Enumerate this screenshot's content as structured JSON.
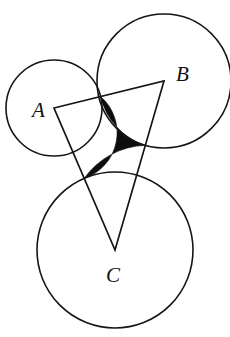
{
  "figure": {
    "width": 230,
    "height": 337,
    "background_color": "#ffffff",
    "stroke_color": "#151515",
    "shaded_color": "#0d0d0d"
  },
  "labels": {
    "a": "A",
    "b": "B",
    "c": "C"
  },
  "chart_data": {
    "type": "diagram",
    "circles": [
      {
        "name": "circle-A",
        "cx": 54,
        "cy": 108,
        "r": 48
      },
      {
        "name": "circle-B",
        "cx": 164,
        "cy": 81,
        "r": 67
      },
      {
        "name": "circle-C",
        "cx": 115,
        "cy": 250,
        "r": 78
      }
    ],
    "triangle": {
      "name": "triangle-ABC",
      "vertices": [
        {
          "label": "A",
          "x": 54,
          "y": 108
        },
        {
          "label": "B",
          "x": 164,
          "y": 81
        },
        {
          "label": "C",
          "x": 115,
          "y": 250
        }
      ]
    },
    "label_positions": [
      {
        "label": "A",
        "x": 32,
        "y": 117
      },
      {
        "label": "B",
        "x": 176,
        "y": 81
      },
      {
        "label": "C",
        "x": 106,
        "y": 282
      }
    ],
    "shaded_region": {
      "name": "curvilinear-triangle",
      "corners": [
        {
          "x": 97,
          "y": 109
        },
        {
          "x": 128,
          "y": 147
        },
        {
          "x": 88,
          "y": 142
        }
      ]
    }
  }
}
